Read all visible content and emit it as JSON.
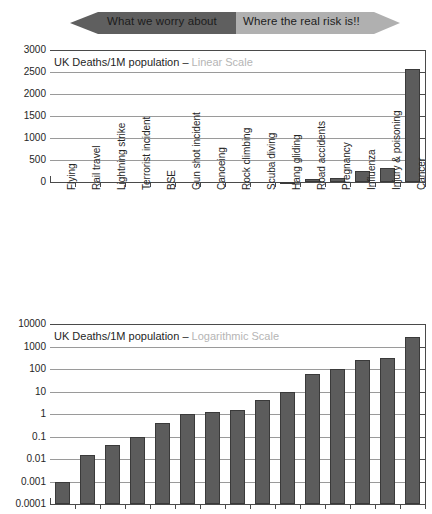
{
  "banner": {
    "left_label": "What we worry about",
    "right_label": "Where the real risk is!!",
    "left_color": "#5f5f5f",
    "right_color": "#b0b0b0"
  },
  "colors": {
    "bar_fill": "#5c5c5c",
    "bar_stroke": "#3a3a3a",
    "gridline": "#9a9a9a",
    "axis": "#4a4a4a",
    "title_muted": "#b5b5b5"
  },
  "chart_data": [
    {
      "type": "bar",
      "id": "linear",
      "title": "UK Deaths/1M population",
      "title_separator": " – ",
      "title_scale": "Linear Scale",
      "scale": "linear",
      "xlabel": "",
      "ylabel": "",
      "ylim": [
        0,
        3000
      ],
      "grid": true,
      "yticks": [
        3000,
        2500,
        2000,
        1500,
        1000,
        500,
        0
      ],
      "ytick_labels": [
        "3000",
        "2500",
        "2000",
        "1500",
        "1000",
        "500",
        "0"
      ],
      "categories": [
        "Flying",
        "Rail travel",
        "Lightning strike",
        "Terrorist incident",
        "BSE",
        "Gun shot incident",
        "Canoeing",
        "Rock climbing",
        "Scuba diving",
        "Hang gliding",
        "Road accidents",
        "Pregnancy",
        "Influenza",
        "Injury & poisoning",
        "Cancer"
      ],
      "values": [
        0.001,
        0.015,
        0.04,
        0.1,
        0.4,
        1.0,
        1.2,
        1.5,
        4,
        10,
        60,
        100,
        250,
        320,
        2570
      ]
    },
    {
      "type": "bar",
      "id": "logarithmic",
      "title": "UK Deaths/1M population",
      "title_separator": " – ",
      "title_scale": "Logarithmic Scale",
      "scale": "log",
      "xlabel": "",
      "ylabel": "",
      "ylim": [
        0.0001,
        10000
      ],
      "grid": true,
      "yticks": [
        10000,
        1000,
        100,
        10,
        1,
        0.1,
        0.01,
        0.001,
        0.0001
      ],
      "ytick_labels": [
        "10000",
        "1000",
        "100",
        "10",
        "1",
        "0.1",
        "0.01",
        "0.001",
        "0.0001"
      ],
      "categories": [
        "Flying",
        "Rail travel",
        "Lightning strike",
        "Terrorist incident",
        "BSE",
        "Gun shot incident",
        "Canoeing",
        "Rock climbing",
        "Scuba diving",
        "Hang gliding",
        "Road accidents",
        "Pregnancy",
        "Influenza",
        "Injury & poisoning",
        "Cancer"
      ],
      "values": [
        0.001,
        0.015,
        0.04,
        0.1,
        0.4,
        1.0,
        1.2,
        1.5,
        4,
        10,
        60,
        100,
        250,
        320,
        2570
      ]
    }
  ]
}
